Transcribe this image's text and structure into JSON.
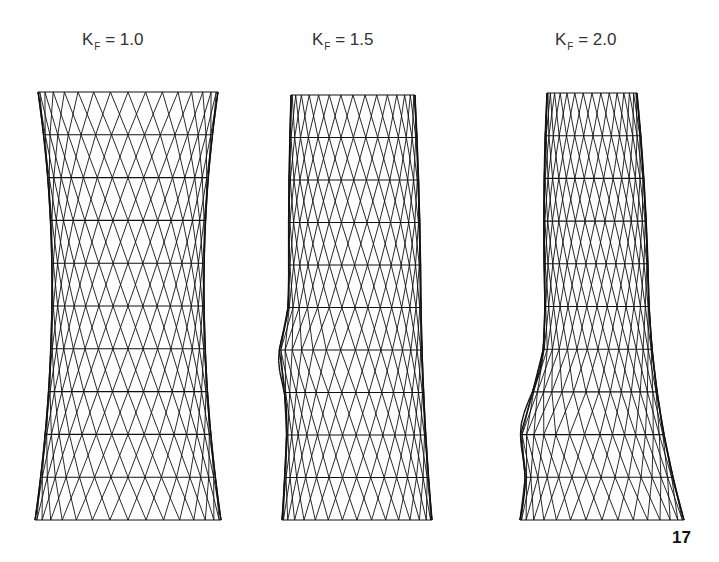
{
  "figure": {
    "panels": [
      {
        "symbol": "K",
        "subscript": "F",
        "equals": "= 1.0",
        "value": 1.0
      },
      {
        "symbol": "K",
        "subscript": "F",
        "equals": "= 1.5",
        "value": 1.5
      },
      {
        "symbol": "K",
        "subscript": "F",
        "equals": "= 2.0",
        "value": 2.0
      }
    ],
    "page_number": "17",
    "line_color": "#111111",
    "background": "#ffffff"
  }
}
